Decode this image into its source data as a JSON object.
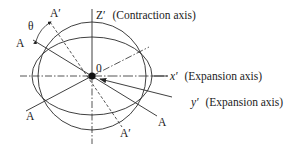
{
  "diagram": {
    "origin_label": "0",
    "theta_label": "θ",
    "z_axis": {
      "symbol": "Z′",
      "description": "(Contraction axis)"
    },
    "x_axis": {
      "symbol": "x′",
      "description": "(Expansion axis)"
    },
    "y_axis": {
      "symbol": "y′",
      "description": "(Expansion axis)"
    },
    "line_A": {
      "label_upper": "A",
      "label_lower": "A"
    },
    "line_A2": {
      "label_lower": "A",
      "label_upper_right": ""
    },
    "line_A_prime": {
      "label_upper": "A′",
      "label_lower": "A′"
    },
    "shapes": {
      "circle": {
        "cx": 92,
        "cy": 76,
        "r": 54
      },
      "ellipse": {
        "cx": 92,
        "cy": 76,
        "rx": 60,
        "ry": 39
      }
    },
    "colors": {
      "stroke": "#2a2a2a",
      "background": "#ffffff"
    }
  }
}
